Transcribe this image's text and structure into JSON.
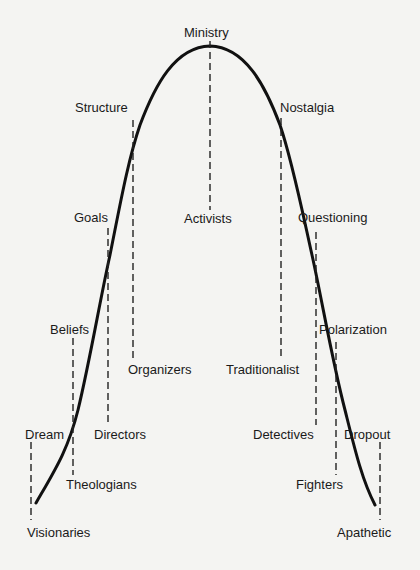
{
  "diagram": {
    "type": "bell-curve-lifecycle",
    "curve_color": "#111111",
    "background": "#f4f4f2",
    "peak": {
      "label": "Ministry",
      "below": "Activists"
    },
    "left_side": [
      {
        "upper": "Structure",
        "lower": "Organizers"
      },
      {
        "upper": "Goals",
        "lower": "Directors"
      },
      {
        "upper": "Beliefs",
        "lower": "Theologians"
      },
      {
        "upper": "Dream",
        "lower": "Visionaries"
      }
    ],
    "right_side": [
      {
        "upper": "Nostalgia",
        "lower": "Traditionalist"
      },
      {
        "upper": "Questioning",
        "lower": "Detectives"
      },
      {
        "upper": "Polarization",
        "lower": "Fighters"
      },
      {
        "upper": "Dropout",
        "lower": "Apathetic"
      }
    ]
  }
}
